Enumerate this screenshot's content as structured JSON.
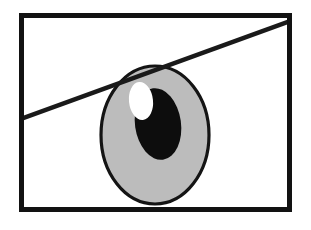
{
  "figure": {
    "caption": "",
    "canvas": {
      "width": 311,
      "height": 230,
      "background": "#ffffff"
    }
  },
  "colors": {
    "ink": "#1a1a1a",
    "frame": "#121212",
    "iris_fill": "#bcbcbc",
    "iris_stroke": "#141414",
    "pupil_fill": "#0d0d0d",
    "highlight_fill": "#ffffff",
    "paper": "#ffffff"
  },
  "frame": {
    "name": "picture-frame",
    "x": 19,
    "y": 13,
    "width": 273,
    "height": 199,
    "stroke_width": 5
  },
  "eyelid_line": {
    "name": "eyelid-line",
    "x1": 21,
    "y1": 119,
    "x2": 290,
    "y2": 21,
    "stroke_width": 4.5
  },
  "iris": {
    "name": "iris-oval",
    "cx": 155,
    "cy": 135,
    "rx": 54,
    "ry": 69,
    "stroke_width": 3.2,
    "fill": "#bcbcbc"
  },
  "pupil": {
    "name": "pupil-ellipse",
    "cx": 158,
    "cy": 124,
    "rx": 23,
    "ry": 36,
    "rotation": -8,
    "fill": "#0d0d0d"
  },
  "highlight": {
    "name": "eye-highlight",
    "cx": 141,
    "cy": 101,
    "rx": 12,
    "ry": 19,
    "rotation": -6,
    "fill": "#ffffff"
  }
}
